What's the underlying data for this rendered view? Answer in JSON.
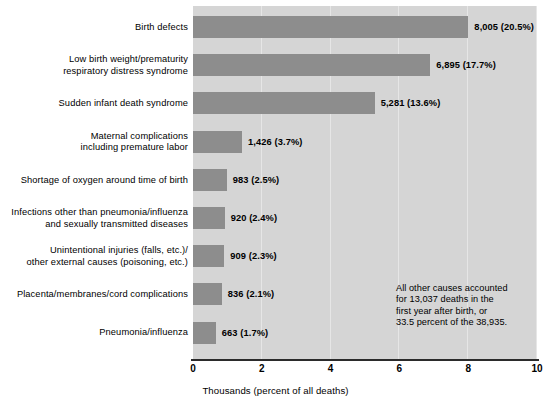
{
  "chart_data": {
    "type": "bar",
    "orientation": "horizontal",
    "title": "",
    "subtitle": "",
    "xlabel": "Thousands (percent of all deaths)",
    "ylabel": "",
    "xlim": [
      0,
      10
    ],
    "xticks": [
      0,
      2,
      4,
      6,
      8,
      10
    ],
    "xtick_labels": [
      "0",
      "2",
      "4",
      "6",
      "8",
      "10"
    ],
    "grid": true,
    "grid_axis": "x",
    "legend": false,
    "categories": [
      "Birth defects",
      "Low birth weight/prematurity\nrespiratory distress syndrome",
      "Sudden infant death syndrome",
      "Maternal complications\nincluding premature labor",
      "Shortage of oxygen around time of birth",
      "Infections other than pneumonia/influenza\nand sexually transmitted diseases",
      "Unintentional injuries (falls, etc.)/\nother external causes (poisoning, etc.)",
      "Placenta/membranes/cord complications",
      "Pneumonia/influenza"
    ],
    "values": [
      8.005,
      6.895,
      5.281,
      1.426,
      0.983,
      0.92,
      0.909,
      0.836,
      0.663
    ],
    "counts": [
      8005,
      6895,
      5281,
      1426,
      983,
      920,
      909,
      836,
      663
    ],
    "percents": [
      20.5,
      17.7,
      13.6,
      3.7,
      2.5,
      2.4,
      2.3,
      2.1,
      1.7
    ],
    "data_labels": [
      "8,005 (20.5%)",
      "6,895 (17.7%)",
      "5,281 (13.6%)",
      "1,426 (3.7%)",
      "983 (2.5%)",
      "920 (2.4%)",
      "909 (2.3%)",
      "836 (2.1%)",
      "663 (1.7%)"
    ],
    "annotations": [
      "All other causes accounted\nfor 13,037 deaths in the\nfirst year after birth, or\n33.5 percent of the 38,935."
    ],
    "colors": {
      "bar": "#8d8d8d",
      "plot_background": "#d5d5d5",
      "gridline": "#e6e6e6",
      "axis": "#2b2b2b",
      "text": "#000000",
      "page_background": "#ffffff"
    }
  }
}
